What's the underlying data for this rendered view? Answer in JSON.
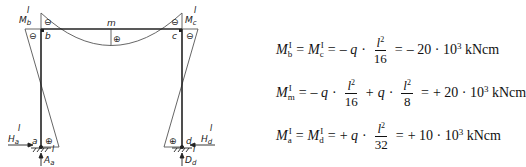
{
  "frame": {
    "nodes": {
      "a": "a",
      "b": "b",
      "c": "c",
      "d": "d",
      "m": "m"
    },
    "moment_labels": {
      "Mb": {
        "main": "M",
        "sub": "b",
        "sup": "I"
      },
      "Mc": {
        "main": "M",
        "sub": "c",
        "sup": "I"
      }
    },
    "reactions": {
      "Ha": {
        "main": "H",
        "sub": "a",
        "sup": "I"
      },
      "Aa": {
        "main": "A",
        "sub": "a",
        "sup": "I"
      },
      "Hd": {
        "main": "H",
        "sub": "d",
        "sup": "I"
      },
      "Dd": {
        "main": "D",
        "sub": "d",
        "sup": "I"
      }
    },
    "signs": {
      "b_beam": "⊖",
      "b_column": "⊖",
      "c_beam": "⊖",
      "c_column": "⊖",
      "m": "⊕",
      "a": "⊕",
      "d": "⊕"
    },
    "colors": {
      "line": "#222222",
      "thin": "#555555"
    }
  },
  "equations": [
    {
      "lhs": [
        {
          "M": "M",
          "sup": "I",
          "sub": "b"
        },
        {
          "M": "M",
          "sup": "I",
          "sub": "c"
        }
      ],
      "terms": [
        {
          "sign": "–",
          "q": "q",
          "num": "l",
          "num_exp": "2",
          "den": "16"
        }
      ],
      "result": "– 20 · 10",
      "result_exp": "3",
      "unit": "kNcm"
    },
    {
      "lhs": [
        {
          "M": "M",
          "sup": "I",
          "sub": "m"
        }
      ],
      "terms": [
        {
          "sign": "–",
          "q": "q",
          "num": "l",
          "num_exp": "2",
          "den": "16"
        },
        {
          "sign": "+",
          "q": "q",
          "num": "l",
          "num_exp": "2",
          "den": "8"
        }
      ],
      "result": "+ 20 · 10",
      "result_exp": "3",
      "unit": "kNcm"
    },
    {
      "lhs": [
        {
          "M": "M",
          "sup": "I",
          "sub": "a"
        },
        {
          "M": "M",
          "sup": "I",
          "sub": "d"
        }
      ],
      "terms": [
        {
          "sign": "+",
          "q": "q",
          "num": "l",
          "num_exp": "2",
          "den": "32"
        }
      ],
      "result": "+ 10 · 10",
      "result_exp": "3",
      "unit": "kNcm"
    }
  ],
  "symbols": {
    "eq": "=",
    "dot": "·"
  }
}
